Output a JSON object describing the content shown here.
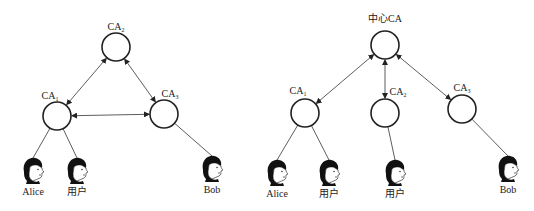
{
  "left_diagram": {
    "title": "mesh trust model",
    "nodes": [
      {
        "id": "ca2",
        "label": "CA",
        "sub": "2",
        "x": 116,
        "y": 47,
        "lx": 116,
        "ly": 30
      },
      {
        "id": "ca1",
        "label": "CA",
        "sub": "1",
        "x": 57,
        "y": 116,
        "lx": 50,
        "ly": 99
      },
      {
        "id": "ca3",
        "label": "CA",
        "sub": "3",
        "x": 164,
        "y": 114,
        "lx": 170,
        "ly": 97
      }
    ],
    "users": [
      {
        "name": "Alice",
        "x": 33,
        "y": 170,
        "parent": "ca1"
      },
      {
        "name": "用户",
        "x": 77,
        "y": 170,
        "parent": "ca1"
      },
      {
        "name": "Bob",
        "x": 212,
        "y": 168,
        "parent": "ca3"
      }
    ],
    "cross_links": [
      [
        "ca1",
        "ca2"
      ],
      [
        "ca2",
        "ca3"
      ],
      [
        "ca1",
        "ca3"
      ]
    ]
  },
  "right_diagram": {
    "title": "hierarchical trust model",
    "root": {
      "id": "root",
      "label": "中心CA",
      "x": 385,
      "y": 45,
      "lx": 385,
      "ly": 22
    },
    "nodes": [
      {
        "id": "r1",
        "label": "CA",
        "sub": "1",
        "x": 305,
        "y": 113,
        "lx": 298,
        "ly": 94
      },
      {
        "id": "r2",
        "label": "CA",
        "sub": "2",
        "x": 385,
        "y": 113,
        "lx": 398,
        "ly": 95
      },
      {
        "id": "r3",
        "label": "CA",
        "sub": "3",
        "x": 462,
        "y": 109,
        "lx": 462,
        "ly": 91
      }
    ],
    "users": [
      {
        "name": "Alice",
        "x": 277,
        "y": 172,
        "parent": "r1"
      },
      {
        "name": "用户",
        "x": 329,
        "y": 172,
        "parent": "r1"
      },
      {
        "name": "用户",
        "x": 395,
        "y": 172,
        "parent": "r2"
      },
      {
        "name": "Bob",
        "x": 508,
        "y": 168,
        "parent": "r3"
      }
    ]
  },
  "style": {
    "stroke": "#222222",
    "background": "#ffffff"
  }
}
